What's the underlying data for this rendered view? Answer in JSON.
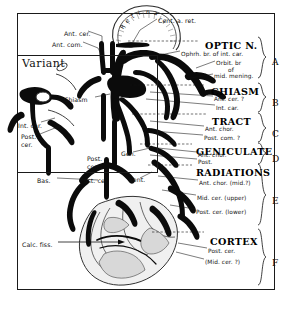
{
  "figure": {
    "variant_label": "Variant"
  },
  "anatomy_labels": [
    {
      "id": "retina",
      "text": "Retina",
      "x": 103,
      "y": 14
    },
    {
      "id": "cent-a-ret",
      "text": "Cent. a. ret.",
      "x": 158,
      "y": 17
    },
    {
      "id": "ant-cer",
      "text": "Ant. cer.",
      "x": 64,
      "y": 30
    },
    {
      "id": "ant-com",
      "text": "Ant. com.",
      "x": 52,
      "y": 41
    },
    {
      "id": "chiasm-mid",
      "text": "Chiasm",
      "x": 64,
      "y": 96
    },
    {
      "id": "int-car-l",
      "text": "Int. car.",
      "x": 18,
      "y": 122
    },
    {
      "id": "post-cer-l1",
      "text": "Post.",
      "x": 21,
      "y": 133
    },
    {
      "id": "post-cer-l2",
      "text": "cer.",
      "x": 21,
      "y": 141
    },
    {
      "id": "post-com-m1",
      "text": "Post.",
      "x": 87,
      "y": 155
    },
    {
      "id": "post-com-m2",
      "text": "com.",
      "x": 87,
      "y": 163
    },
    {
      "id": "bas",
      "text": "Bas.",
      "x": 37,
      "y": 177
    },
    {
      "id": "post-cer-m",
      "text": "Post. cer.",
      "x": 80,
      "y": 177
    },
    {
      "id": "gen",
      "text": "Gen.",
      "x": 121,
      "y": 150
    },
    {
      "id": "vent",
      "text": "Vent.",
      "x": 129,
      "y": 176
    },
    {
      "id": "calc-fiss",
      "text": "Calc. fiss.",
      "x": 22,
      "y": 241
    }
  ],
  "sections": [
    {
      "letter": "A",
      "heading": "OPTIC N.",
      "heading_x": 205,
      "heading_y": 40,
      "letter_x": 272,
      "letter_y": 57,
      "brace_top": 37,
      "brace_bottom": 78,
      "rule_y": 41,
      "sublabels": [
        {
          "text": "Ophrh. br. of int. car.",
          "x": 181,
          "y": 51
        },
        {
          "text": "Orbit. br",
          "x": 216,
          "y": 60
        },
        {
          "text": "of",
          "x": 228,
          "y": 67
        },
        {
          "text": "mid. mening.",
          "x": 214,
          "y": 73
        }
      ]
    },
    {
      "letter": "B",
      "heading": "CHIASM",
      "heading_x": 211,
      "heading_y": 86,
      "letter_x": 272,
      "letter_y": 98,
      "brace_top": 83,
      "brace_bottom": 112,
      "rule_y": 85,
      "sublabels": [
        {
          "text": "Ant. cer. ?",
          "x": 214,
          "y": 96
        },
        {
          "text": "Int. car.",
          "x": 216,
          "y": 105
        }
      ]
    },
    {
      "letter": "C",
      "heading": "TRACT",
      "heading_x": 212,
      "heading_y": 116,
      "letter_x": 272,
      "letter_y": 129,
      "brace_top": 113,
      "brace_bottom": 142,
      "rule_y": 114,
      "sublabels": [
        {
          "text": "Ant. chor.",
          "x": 205,
          "y": 126
        },
        {
          "text": "Post. com. ?",
          "x": 204,
          "y": 135
        }
      ]
    },
    {
      "letter": "D",
      "heading": "GENICULATE",
      "heading_x": 196,
      "heading_y": 146,
      "letter_x": 272,
      "letter_y": 154,
      "brace_top": 143,
      "brace_bottom": 164,
      "rule_y": 144,
      "sublabels": [
        {
          "text": "Ant. chor.",
          "x": 198,
          "y": 152
        },
        {
          "text": "Post.",
          "x": 198,
          "y": 159
        }
      ]
    },
    {
      "letter": "E",
      "heading": "RADIATIONS",
      "heading_x": 196,
      "heading_y": 167,
      "letter_x": 272,
      "letter_y": 196,
      "brace_top": 164,
      "brace_bottom": 225,
      "rule_y": 165,
      "sublabels": [
        {
          "text": "Ant. chor. (mid.?)",
          "x": 199,
          "y": 180
        },
        {
          "text": "Mid. cer. (upper)",
          "x": 197,
          "y": 195
        },
        {
          "text": "Post. cer. (lower)",
          "x": 196,
          "y": 209
        }
      ]
    },
    {
      "letter": "F",
      "heading": "CORTEX",
      "heading_x": 210,
      "heading_y": 236,
      "letter_x": 272,
      "letter_y": 258,
      "brace_top": 229,
      "brace_bottom": 285,
      "rule_y": 232,
      "sublabels": [
        {
          "text": "Post. cer.",
          "x": 208,
          "y": 248
        },
        {
          "text": "(Mid. cer. ?)",
          "x": 205,
          "y": 259
        }
      ]
    }
  ],
  "colors": {
    "ink": "#0b0b0b",
    "paper": "#ffffff",
    "grey": "#d8d8d8"
  }
}
